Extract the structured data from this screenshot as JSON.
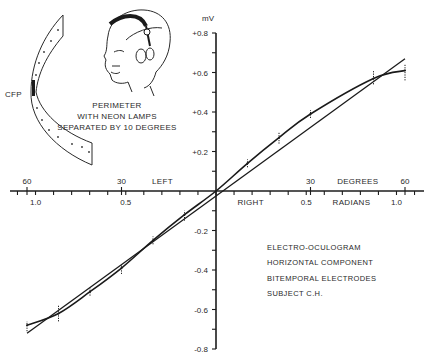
{
  "chart_data": {
    "type": "line",
    "title": "",
    "xlabel_degrees": "DEGREES",
    "xlabel_radians": "RADIANS",
    "xlabel_left": "LEFT",
    "xlabel_right": "RIGHT",
    "ylabel": "mV",
    "x_unit": "degrees",
    "xlim": [
      -60,
      60
    ],
    "ylim": [
      -0.8,
      0.8
    ],
    "y_ticks": [
      {
        "value": 0.8,
        "label": "+0.8"
      },
      {
        "value": 0.6,
        "label": "+0.6"
      },
      {
        "value": 0.4,
        "label": "+0.4"
      },
      {
        "value": 0.2,
        "label": "+0.2"
      },
      {
        "value": -0.2,
        "label": "-0.2"
      },
      {
        "value": -0.4,
        "label": "-0.4"
      },
      {
        "value": -0.6,
        "label": "-0.6"
      },
      {
        "value": -0.8,
        "label": "-0.8"
      }
    ],
    "y_minor_step": 0.1,
    "x_degree_ticks": [
      {
        "value": -60,
        "label": "60"
      },
      {
        "value": -30,
        "label": "30"
      },
      {
        "value": 30,
        "label": "30"
      },
      {
        "value": 60,
        "label": "60"
      }
    ],
    "x_radian_ticks": [
      {
        "value": -1.0,
        "label": "1.0"
      },
      {
        "value": -0.5,
        "label": "0.5"
      },
      {
        "value": 0.5,
        "label": "0.5"
      },
      {
        "value": 1.0,
        "label": "1.0"
      }
    ],
    "x_minor_step_radians": 0.1,
    "series": [
      {
        "name": "Measured (mean)",
        "style": "curve",
        "points": [
          {
            "x": -60,
            "y": -0.68,
            "ymin": -0.71,
            "ymax": -0.66
          },
          {
            "x": -50,
            "y": -0.62,
            "ymin": -0.66,
            "ymax": -0.58
          },
          {
            "x": -40,
            "y": -0.51,
            "ymin": -0.53,
            "ymax": -0.49
          },
          {
            "x": -30,
            "y": -0.39,
            "ymin": -0.42,
            "ymax": -0.37
          },
          {
            "x": -20,
            "y": -0.25,
            "ymin": -0.27,
            "ymax": -0.23
          },
          {
            "x": -10,
            "y": -0.12,
            "ymin": -0.15,
            "ymax": -0.1
          },
          {
            "x": 0,
            "y": 0.0
          },
          {
            "x": 10,
            "y": 0.14,
            "ymin": 0.12,
            "ymax": 0.16
          },
          {
            "x": 20,
            "y": 0.27,
            "ymin": 0.24,
            "ymax": 0.3
          },
          {
            "x": 30,
            "y": 0.39,
            "ymin": 0.37,
            "ymax": 0.41
          },
          {
            "x": 50,
            "y": 0.57,
            "ymin": 0.54,
            "ymax": 0.61
          },
          {
            "x": 60,
            "y": 0.61,
            "ymin": 0.56,
            "ymax": 0.64
          }
        ]
      },
      {
        "name": "Linear fit",
        "style": "straight",
        "points": [
          {
            "x": -60,
            "y": -0.72
          },
          {
            "x": 60,
            "y": 0.67
          }
        ]
      }
    ],
    "annotations": {
      "cfp": "CFP",
      "perimeter_caption": [
        "PERIMETER",
        "WITH NEON LAMPS",
        "SEPARATED BY 10 DEGREES"
      ],
      "notes": [
        "ELECTRO-OCULOGRAM",
        "HORIZONTAL COMPONENT",
        "BITEMPORAL ELECTRODES",
        "SUBJECT C.H."
      ]
    },
    "grid": false,
    "legend": "none"
  }
}
